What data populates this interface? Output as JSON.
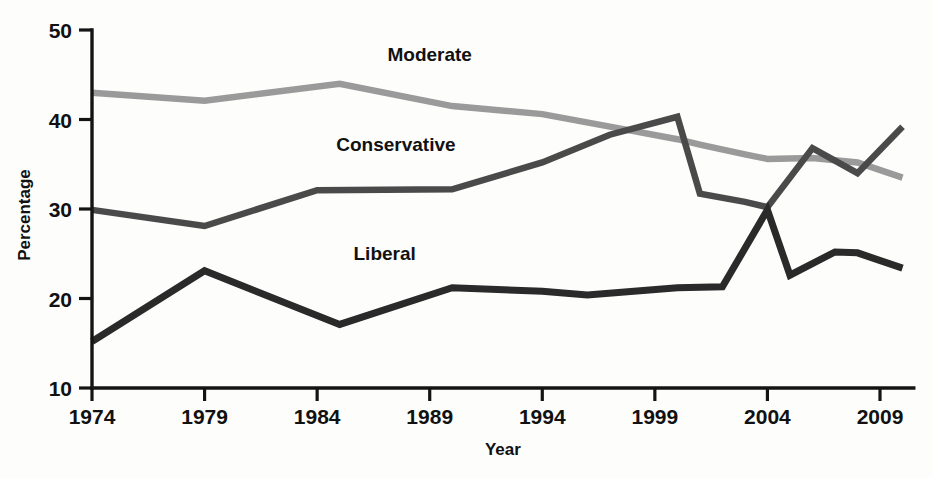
{
  "chart_data": {
    "type": "line",
    "title": "",
    "xlabel": "Year",
    "ylabel": "Percentage",
    "xlim": [
      1974,
      2010.5
    ],
    "ylim": [
      10,
      50
    ],
    "grid": false,
    "legend_position": "inline-labels",
    "x_ticks": [
      1974,
      1979,
      1984,
      1989,
      1994,
      1999,
      2004,
      2009
    ],
    "y_ticks": [
      10,
      20,
      30,
      40,
      50
    ],
    "series": [
      {
        "name": "Moderate",
        "color": "#9a9a9a",
        "label_x": 1989,
        "label_y": 46.5,
        "x": [
          1974,
          1979,
          1985,
          1990,
          1994,
          1997,
          2000,
          2001,
          2003,
          2004,
          2006,
          2008,
          2010
        ],
        "values": [
          43.0,
          42.1,
          44.0,
          41.5,
          40.6,
          39.2,
          37.8,
          37.2,
          36.1,
          35.6,
          35.7,
          35.2,
          33.5
        ]
      },
      {
        "name": "Conservative",
        "color": "#4a4a4a",
        "label_x": 1987.5,
        "label_y": 36.5,
        "x": [
          1974,
          1979,
          1984,
          1990,
          1994,
          1997,
          2000,
          2001,
          2003,
          2004,
          2006,
          2008,
          2010
        ],
        "values": [
          29.9,
          28.1,
          32.1,
          32.2,
          35.2,
          38.3,
          40.3,
          31.7,
          30.8,
          30.2,
          36.8,
          34.0,
          39.2
        ]
      },
      {
        "name": "Liberal",
        "color": "#2a2a2a",
        "label_x": 1987,
        "label_y": 24.3,
        "x": [
          1974,
          1979,
          1985,
          1990,
          1994,
          1996,
          2000,
          2002,
          2004,
          2005,
          2007,
          2008,
          2010
        ],
        "values": [
          15.2,
          23.1,
          17.1,
          21.2,
          20.8,
          20.4,
          21.2,
          21.3,
          29.9,
          22.6,
          25.2,
          25.1,
          23.4
        ]
      }
    ]
  },
  "labels": {
    "y_axis_title": "Percentage",
    "x_axis_title": "Year"
  }
}
